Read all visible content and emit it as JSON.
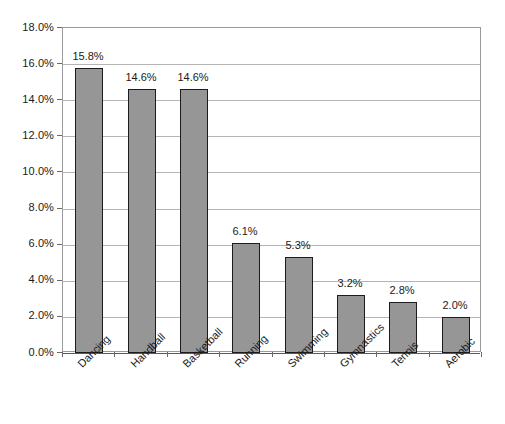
{
  "chart_data": {
    "type": "bar",
    "title": "",
    "subtitle": "",
    "xlabel": "",
    "ylabel": "",
    "categories": [
      "Dancing",
      "Handball",
      "Basketball",
      "Running",
      "Swimming",
      "Gymnastics",
      "Tennis",
      "Aerobic"
    ],
    "values": [
      15.8,
      14.6,
      14.6,
      6.1,
      5.3,
      3.2,
      2.8,
      2.0
    ],
    "value_labels": [
      "15.8%",
      "14.6%",
      "14.6%",
      "6.1%",
      "5.3%",
      "3.2%",
      "2.8%",
      "2.0%"
    ],
    "ylim": [
      0.0,
      18.0
    ],
    "ytick_values": [
      0.0,
      2.0,
      4.0,
      6.0,
      8.0,
      10.0,
      12.0,
      14.0,
      16.0,
      18.0
    ],
    "ytick_labels": [
      "0.0%",
      "2.0%",
      "4.0%",
      "6.0%",
      "8.0%",
      "10.0%",
      "12.0%",
      "14.0%",
      "16.0%",
      "18.0%"
    ],
    "grid": true,
    "legend": false,
    "legend_position": "none",
    "series": [
      {
        "name": "",
        "values": [
          15.8,
          14.6,
          14.6,
          6.1,
          5.3,
          3.2,
          2.8,
          2.0
        ]
      }
    ],
    "colors": {
      "bar_fill": "#969696",
      "bar_border": "#1c1c1c",
      "gridline": "#b4b4b4",
      "axis": "#5a5a5a",
      "frame": "#9a9a9a",
      "text": "#1a1a1a",
      "background": "#ffffff"
    }
  }
}
